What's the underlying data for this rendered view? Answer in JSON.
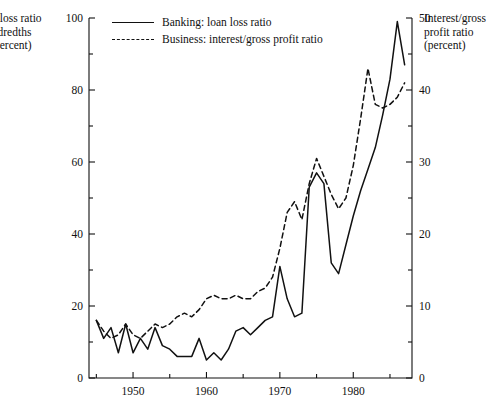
{
  "axes": {
    "left_title": "Loan loss ratio (hundredths of a percent)",
    "left_title_lines": [
      "an loss ratio",
      "undredths",
      "a percent)"
    ],
    "right_title": "Interest/gross profit ratio (percent)",
    "right_title_lines": [
      "Interest/gross",
      "profit ratio",
      "(percent)"
    ]
  },
  "legend": {
    "items": [
      {
        "label": "Banking: loan loss ratio",
        "style": "solid",
        "key": "legend-key-solid"
      },
      {
        "label": "Business: interest/gross profit ratio",
        "style": "dashed",
        "key": "legend-key-dashed"
      }
    ]
  },
  "chart_data": {
    "type": "line",
    "title": "",
    "xlabel": "",
    "ylabel": "Loan loss ratio (hundredths of a percent)",
    "y2label": "Interest/gross profit ratio (percent)",
    "xlim": [
      1944,
      1988
    ],
    "ylim": [
      0,
      100
    ],
    "y2lim": [
      0,
      50
    ],
    "yticks": [
      0,
      20,
      40,
      60,
      80,
      100
    ],
    "yticks_minor": [
      10,
      30,
      50,
      70,
      90
    ],
    "y2ticks": [
      0,
      10,
      20,
      30,
      40,
      50
    ],
    "y2ticks_minor": [
      5,
      15,
      25,
      35,
      45
    ],
    "xticks": [
      1950,
      1960,
      1970,
      1980
    ],
    "xticks_minor": [
      1945,
      1955,
      1965,
      1975,
      1985
    ],
    "xtick_labels": [
      "1950",
      "1960",
      "1970",
      "1980"
    ],
    "grid": false,
    "legend_position": "top-center",
    "series": [
      {
        "name": "Banking: loan loss ratio",
        "style": "solid",
        "axis": "left",
        "x": [
          1945,
          1946,
          1947,
          1948,
          1949,
          1950,
          1951,
          1952,
          1953,
          1954,
          1955,
          1956,
          1957,
          1958,
          1959,
          1960,
          1961,
          1962,
          1963,
          1964,
          1965,
          1966,
          1967,
          1968,
          1969,
          1970,
          1971,
          1972,
          1973,
          1974,
          1975,
          1976,
          1977,
          1978,
          1979,
          1980,
          1981,
          1982,
          1983,
          1984,
          1985,
          1986,
          1987
        ],
        "values": [
          16,
          11,
          14,
          7,
          15,
          7,
          11,
          8,
          14,
          9,
          8,
          6,
          6,
          6,
          11,
          5,
          7,
          5,
          8,
          13,
          14,
          12,
          14,
          16,
          17,
          31,
          22,
          17,
          18,
          53,
          57,
          54,
          32,
          29,
          37,
          45,
          52,
          58,
          64,
          73,
          83,
          99,
          87
        ]
      },
      {
        "name": "Business: interest/gross profit ratio",
        "style": "dashed",
        "axis": "right",
        "x": [
          1945,
          1946,
          1947,
          1948,
          1949,
          1950,
          1951,
          1952,
          1953,
          1954,
          1955,
          1956,
          1957,
          1958,
          1959,
          1960,
          1961,
          1962,
          1963,
          1964,
          1965,
          1966,
          1967,
          1968,
          1969,
          1970,
          1971,
          1972,
          1973,
          1974,
          1975,
          1976,
          1977,
          1978,
          1979,
          1980,
          1981,
          1982,
          1983,
          1984,
          1985,
          1986,
          1987
        ],
        "values_right_axis": [
          8,
          6.5,
          5.5,
          6,
          7.5,
          6,
          5.5,
          6.5,
          7.5,
          7,
          7.5,
          8.5,
          9,
          8.5,
          9.5,
          11,
          11.5,
          11,
          11,
          11.5,
          11,
          11,
          12,
          12.5,
          14,
          18,
          23,
          24.5,
          22,
          27,
          30.5,
          28,
          25.5,
          23.5,
          25,
          29.5,
          36,
          43,
          38,
          37.5,
          38,
          39,
          41
        ],
        "values_left_scale": [
          16,
          13,
          11,
          12,
          15,
          12,
          11,
          13,
          15,
          14,
          15,
          17,
          18,
          17,
          19,
          22,
          23,
          22,
          22,
          23,
          22,
          22,
          24,
          25,
          28,
          36,
          46,
          49,
          44,
          54,
          61,
          56,
          51,
          47,
          50,
          59,
          72,
          86,
          76,
          75,
          76,
          78,
          82
        ]
      }
    ]
  }
}
